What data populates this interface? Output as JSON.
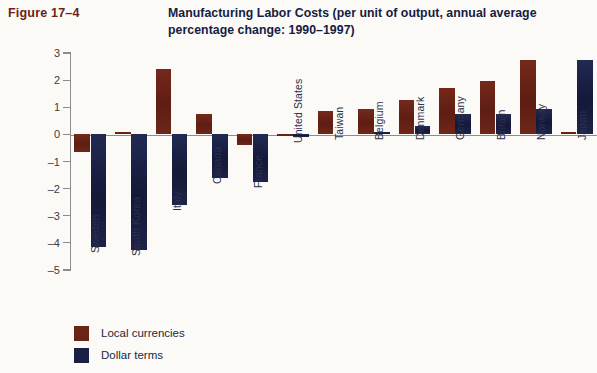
{
  "figure": {
    "label": "Figure 17–4"
  },
  "header": {
    "title": "Manufacturing Labor Costs (per unit of output, annual average percentage change: 1990–1997)"
  },
  "colors": {
    "local": "#6B2318",
    "dollar": "#1A1F44",
    "axis": "#8b8b90",
    "background": "#fbfaf7",
    "figure_label": "#6B2318",
    "title": "#151b43"
  },
  "legend": {
    "position": "bottom-left",
    "items": [
      {
        "label": "Local currencies",
        "color": "#6B2318"
      },
      {
        "label": "Dollar terms",
        "color": "#1A1F44"
      }
    ]
  },
  "axis": {
    "y_ticks": [
      "3",
      "2",
      "1",
      "0",
      "–1",
      "–2",
      "–3",
      "–4",
      "–5"
    ],
    "y_tick_values": [
      3,
      2,
      1,
      0,
      -1,
      -2,
      -3,
      -4,
      -5
    ]
  },
  "chart_data": {
    "type": "bar",
    "title": "Manufacturing Labor Costs (per unit of output, annual average percentage change: 1990–1997)",
    "xlabel": "",
    "ylabel": "",
    "ylim": [
      -5,
      3
    ],
    "grid": false,
    "legend_position": "bottom-left",
    "categories": [
      "Sweden",
      "South Korea",
      "Italy",
      "Canada",
      "France",
      "United States",
      "Taiwan",
      "Belgium",
      "Denmark",
      "Germany",
      "Britain",
      "Norway",
      "Japan"
    ],
    "series": [
      {
        "name": "Local currencies",
        "color": "#6B2318",
        "values": [
          -0.65,
          0.1,
          2.4,
          0.75,
          -0.4,
          -0.05,
          0.85,
          0.95,
          1.25,
          1.7,
          1.95,
          2.75,
          0.1
        ]
      },
      {
        "name": "Dollar terms",
        "color": "#1A1F44",
        "values": [
          -4.15,
          -4.25,
          -2.6,
          -1.6,
          -1.75,
          -0.1,
          0.0,
          0.1,
          0.3,
          0.75,
          0.75,
          0.95,
          2.75
        ]
      }
    ]
  }
}
